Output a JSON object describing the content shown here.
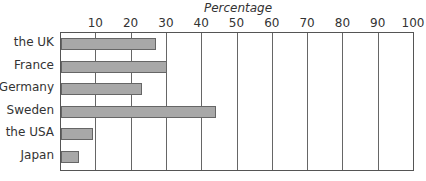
{
  "chart_data": {
    "type": "bar",
    "orientation": "horizontal",
    "title": "Percentage",
    "xlabel": "Percentage",
    "ylabel": "",
    "xlim": [
      0,
      100
    ],
    "xticks": [
      10,
      20,
      30,
      40,
      50,
      60,
      70,
      80,
      90,
      100
    ],
    "grid": true,
    "legend": null,
    "categories": [
      "the UK",
      "France",
      "Germany",
      "Sweden",
      "the USA",
      "Japan"
    ],
    "values": [
      27,
      30,
      23,
      44,
      9,
      5
    ],
    "colors": {
      "bar": "#a8a8a8",
      "bar_border": "#666666",
      "grid": "#666666"
    }
  }
}
